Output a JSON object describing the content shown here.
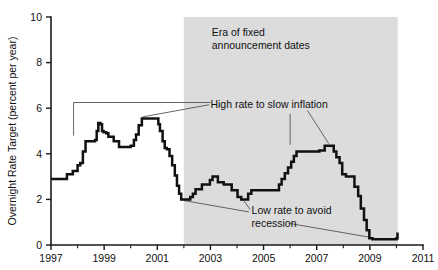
{
  "figure": {
    "background_color": "#ffffff",
    "line_color": "#111111",
    "shade_color": "#dcdcdc",
    "text_color": "#111111"
  },
  "chart_data": {
    "type": "line",
    "title": "",
    "subtitle": "",
    "xlabel": "",
    "ylabel": "Overnight Rate Target (percent per year)",
    "xlim": [
      1997,
      2011
    ],
    "ylim": [
      0,
      10
    ],
    "grid": false,
    "legend": "none",
    "x_ticks_major": [
      1997,
      1999,
      2001,
      2003,
      2005,
      2007,
      2009,
      2011
    ],
    "x_tick_labels": [
      "1997",
      "1999",
      "2001",
      "2003",
      "2005",
      "2007",
      "2009",
      "2011"
    ],
    "x_ticks_minor": [
      1998,
      2000,
      2002,
      2004,
      2006,
      2008,
      2010
    ],
    "y_ticks_major": [
      0,
      2,
      4,
      6,
      8,
      10
    ],
    "y_tick_labels": [
      "0",
      "2",
      "4",
      "6",
      "8",
      "10"
    ],
    "shaded_region": {
      "label": "Era of fixed announcement dates",
      "x_start": 2002.0,
      "x_end": 2010.05,
      "color": "#dcdcdc"
    },
    "series": [
      {
        "name": "Overnight Rate Target",
        "step": true,
        "points": [
          [
            1997.0,
            2.9
          ],
          [
            1997.55,
            2.9
          ],
          [
            1997.6,
            3.1
          ],
          [
            1997.78,
            3.1
          ],
          [
            1997.82,
            3.25
          ],
          [
            1997.95,
            3.25
          ],
          [
            1998.0,
            3.5
          ],
          [
            1998.1,
            3.6
          ],
          [
            1998.2,
            4.1
          ],
          [
            1998.3,
            4.55
          ],
          [
            1998.62,
            4.55
          ],
          [
            1998.66,
            4.6
          ],
          [
            1998.72,
            5.0
          ],
          [
            1998.78,
            5.35
          ],
          [
            1998.86,
            5.3
          ],
          [
            1998.92,
            5.0
          ],
          [
            1998.98,
            4.95
          ],
          [
            1999.08,
            4.9
          ],
          [
            1999.16,
            4.75
          ],
          [
            1999.3,
            4.75
          ],
          [
            1999.36,
            4.55
          ],
          [
            1999.5,
            4.55
          ],
          [
            1999.56,
            4.3
          ],
          [
            1999.95,
            4.3
          ],
          [
            2000.0,
            4.35
          ],
          [
            2000.12,
            4.6
          ],
          [
            2000.2,
            4.85
          ],
          [
            2000.3,
            5.25
          ],
          [
            2000.42,
            5.55
          ],
          [
            2000.98,
            5.55
          ],
          [
            2001.04,
            5.3
          ],
          [
            2001.1,
            5.0
          ],
          [
            2001.2,
            4.55
          ],
          [
            2001.28,
            4.25
          ],
          [
            2001.36,
            4.2
          ],
          [
            2001.46,
            3.9
          ],
          [
            2001.56,
            3.5
          ],
          [
            2001.66,
            3.05
          ],
          [
            2001.74,
            2.6
          ],
          [
            2001.82,
            2.25
          ],
          [
            2001.9,
            2.0
          ],
          [
            2002.18,
            2.0
          ],
          [
            2002.24,
            2.1
          ],
          [
            2002.34,
            2.25
          ],
          [
            2002.44,
            2.45
          ],
          [
            2002.62,
            2.45
          ],
          [
            2002.68,
            2.65
          ],
          [
            2002.92,
            2.65
          ],
          [
            2002.98,
            2.85
          ],
          [
            2003.08,
            3.0
          ],
          [
            2003.2,
            3.0
          ],
          [
            2003.28,
            2.75
          ],
          [
            2003.42,
            2.75
          ],
          [
            2003.5,
            2.65
          ],
          [
            2003.72,
            2.65
          ],
          [
            2003.8,
            2.4
          ],
          [
            2003.95,
            2.4
          ],
          [
            2004.02,
            2.1
          ],
          [
            2004.16,
            2.0
          ],
          [
            2004.34,
            2.0
          ],
          [
            2004.42,
            2.25
          ],
          [
            2004.54,
            2.4
          ],
          [
            2004.86,
            2.4
          ],
          [
            2005.0,
            2.4
          ],
          [
            2005.5,
            2.4
          ],
          [
            2005.58,
            2.65
          ],
          [
            2005.68,
            2.9
          ],
          [
            2005.8,
            3.15
          ],
          [
            2005.92,
            3.4
          ],
          [
            2006.04,
            3.65
          ],
          [
            2006.14,
            3.9
          ],
          [
            2006.24,
            4.1
          ],
          [
            2007.02,
            4.1
          ],
          [
            2007.1,
            4.15
          ],
          [
            2007.3,
            4.35
          ],
          [
            2007.56,
            4.35
          ],
          [
            2007.64,
            4.1
          ],
          [
            2007.74,
            3.85
          ],
          [
            2007.86,
            3.6
          ],
          [
            2007.96,
            3.1
          ],
          [
            2008.1,
            3.0
          ],
          [
            2008.34,
            3.0
          ],
          [
            2008.42,
            2.55
          ],
          [
            2008.56,
            2.15
          ],
          [
            2008.66,
            1.6
          ],
          [
            2008.78,
            1.1
          ],
          [
            2008.88,
            0.65
          ],
          [
            2008.98,
            0.3
          ],
          [
            2009.1,
            0.25
          ],
          [
            2009.98,
            0.25
          ],
          [
            2010.0,
            0.3
          ],
          [
            2010.04,
            0.55
          ]
        ]
      }
    ],
    "annotations": [
      {
        "id": "era-label",
        "text_lines": [
          "Era of fixed",
          "announcement dates"
        ],
        "x": 2003.05,
        "y": 9.15
      },
      {
        "id": "high-rate-label",
        "text_lines": [
          "High rate to slow inflation"
        ],
        "x": 2003.0,
        "y": 6.0
      },
      {
        "id": "low-rate-label",
        "text_lines": [
          "Low rate to avoid",
          "recession"
        ],
        "x": 2004.55,
        "y": 1.35
      }
    ],
    "leader_lines": [
      {
        "id": "leader-high-1998-bracket",
        "points": [
          [
            2003.0,
            6.25
          ],
          [
            1997.85,
            6.25
          ],
          [
            1997.85,
            4.8
          ]
        ]
      },
      {
        "id": "leader-high-2000-peak",
        "points": [
          [
            2002.95,
            6.15
          ],
          [
            2000.45,
            5.62
          ]
        ]
      },
      {
        "id": "leader-high-2006-vertical",
        "points": [
          [
            2006.0,
            5.75
          ],
          [
            2006.0,
            4.4
          ]
        ]
      },
      {
        "id": "leader-high-2007-peak",
        "points": [
          [
            2006.65,
            5.9
          ],
          [
            2007.45,
            4.45
          ]
        ]
      },
      {
        "id": "leader-low-2002-trough",
        "points": [
          [
            2004.45,
            1.45
          ],
          [
            2002.0,
            1.95
          ]
        ]
      },
      {
        "id": "leader-low-2004-trough",
        "points": [
          [
            2004.5,
            1.55
          ],
          [
            2004.25,
            1.95
          ]
        ]
      },
      {
        "id": "leader-low-2009-floor",
        "points": [
          [
            2005.95,
            0.95
          ],
          [
            2009.1,
            0.32
          ]
        ]
      }
    ]
  }
}
